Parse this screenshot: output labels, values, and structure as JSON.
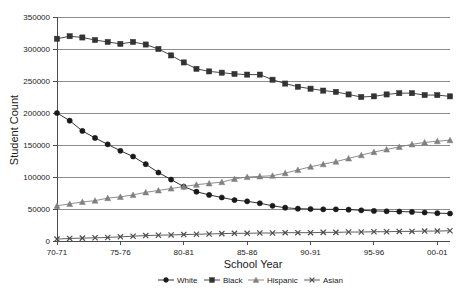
{
  "chart_data": {
    "type": "line",
    "title": "",
    "xlabel": "School Year",
    "ylabel": "Student Count",
    "ylim": [
      0,
      350000
    ],
    "ytick_values": [
      0,
      50000,
      100000,
      150000,
      200000,
      250000,
      300000,
      350000
    ],
    "ytick_labels": [
      "0",
      "50000",
      "100000",
      "150000",
      "200000",
      "250000",
      "300000",
      "350000"
    ],
    "grid": true,
    "legend_position": "bottom",
    "x": [
      "70-71",
      "71-72",
      "72-73",
      "73-74",
      "74-75",
      "75-76",
      "76-77",
      "77-78",
      "78-79",
      "79-80",
      "80-81",
      "81-82",
      "82-83",
      "83-84",
      "84-85",
      "85-86",
      "86-87",
      "87-88",
      "88-89",
      "89-90",
      "90-91",
      "91-92",
      "92-93",
      "93-94",
      "94-95",
      "95-96",
      "96-97",
      "97-98",
      "98-99",
      "99-00",
      "00-01",
      "01-02"
    ],
    "xtick_labels": [
      "70-71",
      "75-76",
      "80-81",
      "85-86",
      "90-91",
      "95-96",
      "00-01"
    ],
    "xtick_indices": [
      0,
      5,
      10,
      15,
      20,
      25,
      30
    ],
    "series": [
      {
        "name": "White",
        "marker": "circle",
        "color": "#1a1a1a",
        "values": [
          200000,
          188000,
          172000,
          161000,
          151000,
          141000,
          132000,
          120000,
          107000,
          96000,
          85000,
          77000,
          72000,
          68000,
          64000,
          62000,
          59000,
          55000,
          52000,
          50500,
          50000,
          49500,
          49500,
          49000,
          48000,
          47000,
          46500,
          46000,
          45500,
          44500,
          43500,
          43000
        ]
      },
      {
        "name": "Black",
        "marker": "square",
        "color": "#333333",
        "values": [
          316000,
          320000,
          318000,
          314000,
          311000,
          308000,
          311000,
          307000,
          300000,
          290000,
          279000,
          269000,
          265000,
          263000,
          261000,
          260000,
          260000,
          252000,
          246000,
          241000,
          238000,
          235000,
          233000,
          229000,
          225000,
          226000,
          229000,
          231000,
          231000,
          228000,
          228000,
          226000
        ]
      },
      {
        "name": "Hispanic",
        "marker": "triangle",
        "color": "#808080",
        "values": [
          55000,
          58000,
          61000,
          63000,
          67000,
          69000,
          72000,
          76000,
          79000,
          82000,
          85000,
          88000,
          90000,
          92000,
          97000,
          100000,
          101000,
          102000,
          106000,
          111000,
          116000,
          120000,
          124000,
          129000,
          134000,
          139000,
          143000,
          147000,
          151000,
          154000,
          156000,
          157500
        ]
      },
      {
        "name": "Asian",
        "marker": "x",
        "color": "#4d4d4d",
        "values": [
          3000,
          4000,
          4500,
          5000,
          5500,
          6500,
          7500,
          8500,
          9000,
          9500,
          10000,
          10500,
          11000,
          11500,
          12000,
          12000,
          12500,
          12500,
          13000,
          13000,
          13000,
          13500,
          13500,
          14000,
          14000,
          14500,
          14500,
          15000,
          15000,
          15500,
          15500,
          16000
        ]
      }
    ]
  },
  "legend": {
    "entries": [
      {
        "label": "White"
      },
      {
        "label": "Black"
      },
      {
        "label": "Hispanic"
      },
      {
        "label": "Asian"
      }
    ]
  }
}
